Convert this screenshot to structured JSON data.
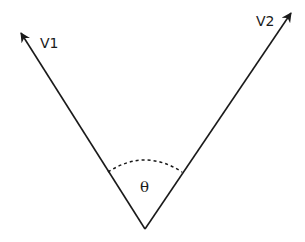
{
  "diagram": {
    "type": "vector-angle",
    "vectors": [
      {
        "label": "V1",
        "from": [
          145,
          229
        ],
        "to": [
          19,
          30
        ]
      },
      {
        "label": "V2",
        "from": [
          145,
          229
        ],
        "to": [
          293,
          10
        ]
      }
    ],
    "angle": {
      "symbol": "θ",
      "style": "dashed-arc"
    },
    "colors": {
      "stroke": "#1a1a1a",
      "background": "#ffffff"
    }
  }
}
